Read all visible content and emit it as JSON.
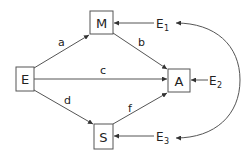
{
  "diagram": {
    "nodes": {
      "M": {
        "label": "M"
      },
      "E": {
        "label": "E"
      },
      "A": {
        "label": "A"
      },
      "S": {
        "label": "S"
      }
    },
    "edges": [
      {
        "from": "E",
        "to": "M",
        "label": "a"
      },
      {
        "from": "M",
        "to": "A",
        "label": "b"
      },
      {
        "from": "E",
        "to": "A",
        "label": "c"
      },
      {
        "from": "E",
        "to": "S",
        "label": "d"
      },
      {
        "from": "S",
        "to": "A",
        "label": "f"
      }
    ],
    "errors": {
      "E1": {
        "base": "E",
        "sub": "1",
        "target": "M"
      },
      "E2": {
        "base": "E",
        "sub": "2",
        "target": "A"
      },
      "E3": {
        "base": "E",
        "sub": "3",
        "target": "S"
      }
    },
    "correlations": [
      {
        "between": [
          "E1",
          "E3"
        ],
        "type": "bidirectional-curve"
      }
    ],
    "colors": {
      "stroke": "#555555",
      "text": "#222222",
      "background": "#ffffff"
    }
  }
}
